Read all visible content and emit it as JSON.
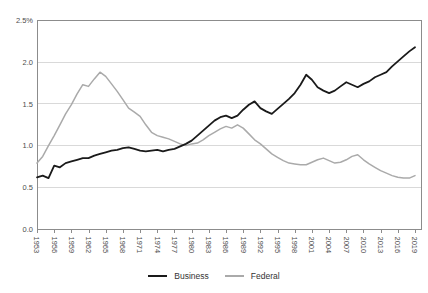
{
  "chart_data": {
    "type": "line",
    "title": "",
    "xlabel": "",
    "ylabel": "",
    "x_start": 1953,
    "x_end": 2019,
    "ylim": [
      0,
      2.5
    ],
    "grid": "horizontal",
    "legend_position": "bottom-center",
    "y_tick_labels": [
      "2.5%",
      "2.0",
      "1.5",
      "1.0",
      "0.5",
      "0.0"
    ],
    "y_tick_values": [
      2.5,
      2.0,
      1.5,
      1.0,
      0.5,
      0.0
    ],
    "x_tick_labels": [
      "1953",
      "1956",
      "1959",
      "1962",
      "1965",
      "1968",
      "1971",
      "1974",
      "1977",
      "1980",
      "1983",
      "1986",
      "1989",
      "1992",
      "1995",
      "1998",
      "2001",
      "2004",
      "2007",
      "2010",
      "2013",
      "2016",
      "2019"
    ],
    "series": [
      {
        "name": "Business",
        "color": "#1a1a1a",
        "values": [
          0.62,
          0.64,
          0.61,
          0.76,
          0.74,
          0.79,
          0.81,
          0.83,
          0.85,
          0.85,
          0.88,
          0.9,
          0.92,
          0.94,
          0.95,
          0.97,
          0.98,
          0.96,
          0.94,
          0.93,
          0.94,
          0.95,
          0.93,
          0.95,
          0.96,
          0.99,
          1.02,
          1.06,
          1.12,
          1.18,
          1.24,
          1.3,
          1.34,
          1.36,
          1.33,
          1.36,
          1.43,
          1.49,
          1.53,
          1.45,
          1.41,
          1.38,
          1.44,
          1.5,
          1.56,
          1.63,
          1.73,
          1.85,
          1.79,
          1.7,
          1.66,
          1.63,
          1.66,
          1.71,
          1.76,
          1.73,
          1.7,
          1.74,
          1.77,
          1.82,
          1.85,
          1.88,
          1.95,
          2.01,
          2.07,
          2.13,
          2.18
        ]
      },
      {
        "name": "Federal",
        "color": "#aaaaaa",
        "values": [
          0.79,
          0.87,
          1.0,
          1.12,
          1.25,
          1.38,
          1.49,
          1.62,
          1.73,
          1.71,
          1.8,
          1.88,
          1.83,
          1.74,
          1.65,
          1.55,
          1.45,
          1.4,
          1.35,
          1.25,
          1.16,
          1.12,
          1.1,
          1.08,
          1.05,
          1.02,
          1.0,
          1.02,
          1.03,
          1.07,
          1.12,
          1.16,
          1.2,
          1.23,
          1.21,
          1.25,
          1.21,
          1.14,
          1.07,
          1.02,
          0.96,
          0.9,
          0.86,
          0.82,
          0.79,
          0.78,
          0.77,
          0.77,
          0.8,
          0.83,
          0.85,
          0.82,
          0.79,
          0.8,
          0.83,
          0.87,
          0.89,
          0.83,
          0.78,
          0.74,
          0.7,
          0.67,
          0.64,
          0.62,
          0.61,
          0.61,
          0.64
        ]
      }
    ],
    "colors": {
      "frame": "#8c8c8c",
      "gridline": "#d9d9d9",
      "tick": "#8c8c8c",
      "tick_label": "#4d4d4d",
      "background": "#ffffff"
    }
  }
}
